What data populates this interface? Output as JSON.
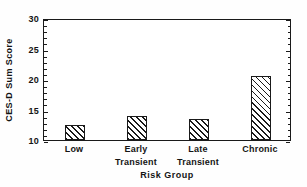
{
  "chart_data": {
    "type": "bar",
    "title": "",
    "xlabel": "Risk Group",
    "ylabel": "CES-D Sum Score",
    "categories": [
      "Low",
      "Early Transient",
      "Late Transient",
      "Chronic"
    ],
    "category_lines": [
      [
        "Low",
        ""
      ],
      [
        "Early",
        "Transient"
      ],
      [
        "Late",
        "Transient"
      ],
      [
        "Chronic",
        ""
      ]
    ],
    "values": [
      12.5,
      14.0,
      13.4,
      20.5
    ],
    "ylim": [
      10,
      30
    ],
    "xlim": [
      0,
      4
    ],
    "yticks": [
      10,
      15,
      20,
      25,
      30
    ],
    "yticklabels": [
      "10",
      "15",
      "20",
      "25",
      "30"
    ],
    "yminorticks": [
      11,
      12,
      13,
      14,
      16,
      17,
      18,
      19,
      21,
      22,
      23,
      24,
      26,
      27,
      28,
      29
    ],
    "grid": false,
    "legend": false,
    "bar_fill": "hatch-diagonal",
    "bar_edge_color": "#1a1a1a",
    "bar_face_color": "#ffffff",
    "axis_color": "#1a1a1a",
    "background": "#ffffff",
    "bar_width_fraction": 0.33
  }
}
